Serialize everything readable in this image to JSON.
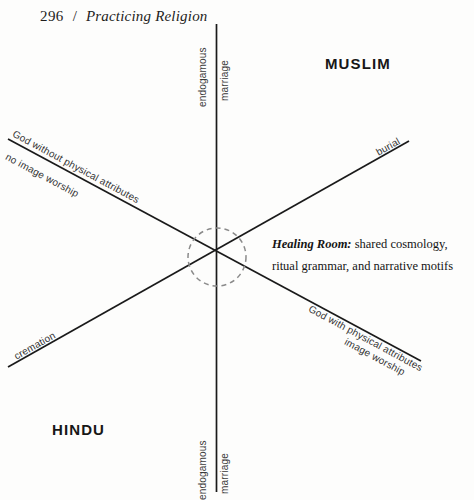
{
  "page": {
    "folio": "296",
    "separator": "/",
    "running_head": "Practicing Religion",
    "background_color": "#fdfdfc",
    "ink_color": "#1f1d1c"
  },
  "diagram": {
    "vertical_axis": {
      "top_label_outer": "endogamous",
      "top_label_inner": "marriage",
      "bottom_label_outer": "endogamous",
      "bottom_label_inner": "marriage",
      "line_color": "#1a1a1a"
    },
    "diagonal_ascending": {
      "lower_left_label": "cremation",
      "upper_right_label": "burial",
      "line_color": "#1a1a1a"
    },
    "diagonal_descending": {
      "upper_left_label_above": "God without physical attributes",
      "upper_left_label_below": "no image worship",
      "lower_right_label_above": "God with physical attributes",
      "lower_right_label_below": "image worship",
      "line_color": "#1a1a1a"
    },
    "intersection": {
      "marker": "dashed-circle",
      "stroke_color": "#8a8a8a"
    },
    "corner_labels": {
      "top_right": "MUSLIM",
      "bottom_left": "HINDU"
    },
    "annotation": {
      "lead_in": "Healing Room:",
      "line_one": "shared cosmology,",
      "line_two": "ritual grammar, and narrative motifs"
    }
  }
}
